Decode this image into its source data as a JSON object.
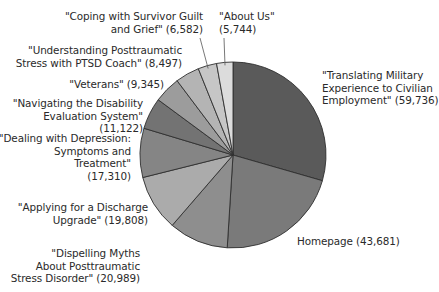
{
  "chart_data": {
    "type": "pie",
    "title": "",
    "start": "12 o'clock",
    "direction": "clockwise",
    "slices": [
      {
        "label": "\"Translating Military Experience to Civilian Employment\"",
        "value": 59736,
        "display": "\"Translating Military\nExperience to Civilian\nEmployment\" (59,736)",
        "color": "#5a5a5a"
      },
      {
        "label": "Homepage",
        "value": 43681,
        "display": "Homepage (43,681)",
        "color": "#7a7a7a"
      },
      {
        "label": "\"Dispelling Myths About Posttraumatic Stress Disorder\"",
        "value": 20989,
        "display": "\"Dispelling Myths\nAbout Posttraumatic\nStress Disorder\" (20,989)",
        "color": "#8e8e8e"
      },
      {
        "label": "\"Applying for a Discharge Upgrade\"",
        "value": 19808,
        "display": "\"Applying for a Discharge\nUpgrade\" (19,808)",
        "color": "#ababab"
      },
      {
        "label": "\"Dealing with Depression: Symptoms and Treatment\"",
        "value": 17310,
        "display": "\"Dealing with Depression:\nSymptoms and\nTreatment\"\n(17,310)",
        "color": "#858585"
      },
      {
        "label": "\"Navigating the Disability Evaluation System\"",
        "value": 11122,
        "display": "\"Navigating the Disability\nEvaluation System\"\n(11,122)",
        "color": "#737373"
      },
      {
        "label": "\"Veterans\"",
        "value": 9345,
        "display": "\"Veterans\" (9,345)",
        "color": "#9c9c9c"
      },
      {
        "label": "\"Understanding Posttraumatic Stress with PTSD Coach\"",
        "value": 8497,
        "display": "\"Understanding Posttraumatic\nStress with PTSD Coach\" (8,497)",
        "color": "#b4b4b4"
      },
      {
        "label": "\"Coping with Survivor Guilt and Grief\"",
        "value": 6582,
        "display": "\"Coping with Survivor Guilt\nand Grief\" (6,582)",
        "color": "#c6c6c6"
      },
      {
        "label": "\"About Us\"",
        "value": 5744,
        "display": "\"About Us\"\n(5,744)",
        "color": "#dcdcdc"
      }
    ],
    "total": 202814,
    "legend": "none (direct labels with leader lines)"
  }
}
